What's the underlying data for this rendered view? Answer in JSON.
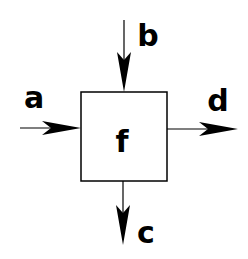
{
  "diagram": {
    "type": "block-function",
    "block": {
      "label": "f"
    },
    "inputs": [
      {
        "id": "a",
        "label": "a",
        "side": "left"
      },
      {
        "id": "b",
        "label": "b",
        "side": "top"
      }
    ],
    "outputs": [
      {
        "id": "d",
        "label": "d",
        "side": "right"
      },
      {
        "id": "c",
        "label": "c",
        "side": "bottom"
      }
    ],
    "colors": {
      "stroke": "#000000",
      "background": "#ffffff"
    }
  }
}
